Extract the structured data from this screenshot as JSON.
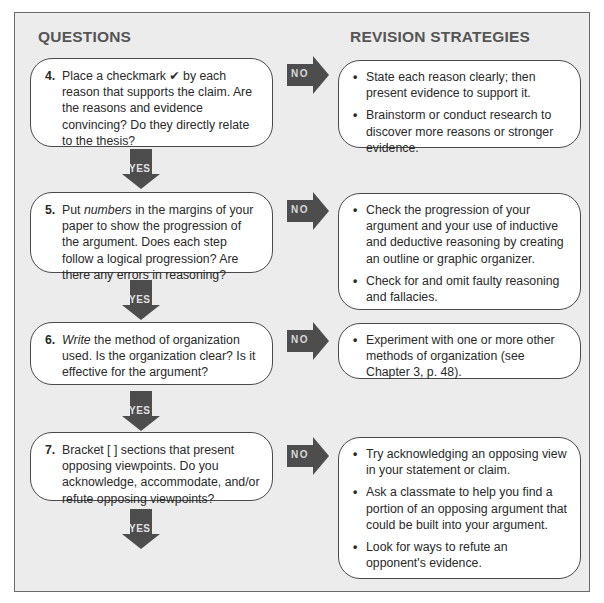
{
  "headers": {
    "questions": "QUESTIONS",
    "strategies": "REVISION STRATEGIES"
  },
  "arrows": {
    "no_label": "NO",
    "yes_label": "YES"
  },
  "colors": {
    "panel_bg": "#ececec",
    "arrow_fill": "#4d4d4d",
    "box_bg": "#ffffff"
  },
  "rows": [
    {
      "number": "4.",
      "question_pre": "Place a checkmark ",
      "question_em": "",
      "check_icon": "✔",
      "question_post": " by each reason that supports the claim. Are the reasons and evidence convincing? Do they directly relate to the thesis?",
      "strategies": [
        "State each reason clearly; then present evidence to support it.",
        "Brainstorm or conduct research to discover more reasons or stronger evidence."
      ]
    },
    {
      "number": "5.",
      "question_pre": "Put ",
      "question_em": "numbers",
      "question_post": " in the margins of your paper to show the progression of the argument. Does each step follow a logical progression? Are there any errors in reasoning?",
      "strategies": [
        "Check the progression of your argument and your use of inductive and deductive reasoning by creating an outline or graphic organizer.",
        "Check for and omit faulty reasoning and fallacies."
      ]
    },
    {
      "number": "6.",
      "question_pre": "",
      "question_em": "Write",
      "question_post": " the method of organization used. Is the organization clear? Is it effective for the argument?",
      "strategies": [
        "Experiment with one or more other methods of organization (see Chapter 3, p. 48)."
      ]
    },
    {
      "number": "7.",
      "question_pre": "Bracket [ ] sections that present opposing viewpoints. Do you acknowledge, accommodate, and/or refute opposing viewpoints?",
      "question_em": "",
      "question_post": "",
      "strategies": [
        "Try acknowledging an opposing view in your statement or claim.",
        "Ask a classmate to help you find a portion of an opposing argument that could be built into your argument.",
        "Look for ways to refute an opponent's evidence."
      ]
    }
  ],
  "bullet_glyph": "•"
}
